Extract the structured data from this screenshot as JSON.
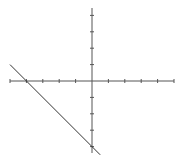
{
  "chart_data": {
    "type": "line",
    "title": "",
    "xlabel": "",
    "ylabel": "",
    "xlim": [
      -5,
      5
    ],
    "ylim": [
      -4.5,
      4.5
    ],
    "grid": false,
    "legend": null,
    "x_ticks": [
      -5,
      -4,
      -3,
      -2,
      -1,
      1,
      2,
      3,
      4,
      5
    ],
    "y_ticks": [
      -4,
      -3,
      -2,
      -1,
      1,
      2,
      3,
      4
    ],
    "tick_labels_shown": false,
    "series": [
      {
        "name": "line",
        "equation": "y = -x - 4",
        "x": [
          -5,
          0.5
        ],
        "y": [
          1,
          -4.5
        ],
        "color": "#333333"
      }
    ],
    "annotations": []
  },
  "style": {
    "axis_color": "#555555",
    "line_color": "#333333",
    "background": "#ffffff"
  }
}
